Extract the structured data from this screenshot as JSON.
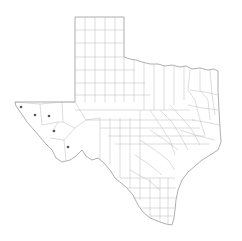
{
  "map": {
    "title": "Texas counties",
    "region": "Texas",
    "colors": {
      "background": "#ffffff",
      "border": "#9a9a9a",
      "county_lines": "#b4b4b4",
      "marker": "#555555"
    },
    "markers": [
      {
        "id": "marker-1",
        "x": 21,
        "y": 107
      },
      {
        "id": "marker-2",
        "x": 35,
        "y": 115
      },
      {
        "id": "marker-3",
        "x": 49,
        "y": 116
      },
      {
        "id": "marker-4",
        "x": 54,
        "y": 131
      },
      {
        "id": "marker-5",
        "x": 68,
        "y": 147
      }
    ]
  }
}
